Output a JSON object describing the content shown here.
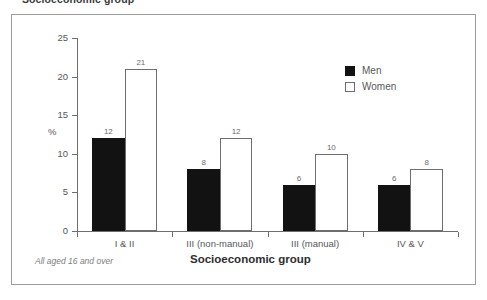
{
  "figure": {
    "title_fragment": "Socioeconomic group",
    "footnote": "All aged 16 and over"
  },
  "legend": {
    "position": "top-right",
    "entries": [
      {
        "label": "Men",
        "swatch": "black-filled-square"
      },
      {
        "label": "Women",
        "swatch": "white-outlined-square"
      }
    ]
  },
  "axes": {
    "y_title": "%",
    "x_title": "Socioeconomic group",
    "y_ticks": [
      "0",
      "5",
      "10",
      "15",
      "20",
      "25"
    ]
  },
  "chart_data": {
    "type": "bar",
    "title": "",
    "subtitle": "",
    "xlabel": "Socioeconomic group",
    "ylabel": "%",
    "categories": [
      "I & II",
      "III (non-manual)",
      "III (manual)",
      "IV & V"
    ],
    "series": [
      {
        "name": "Men",
        "values": [
          12,
          8,
          6,
          6
        ],
        "color": "#121212"
      },
      {
        "name": "Women",
        "values": [
          21,
          12,
          10,
          8
        ],
        "color": "#ffffff"
      }
    ],
    "ylim": [
      0,
      25
    ],
    "yticks": [
      0,
      5,
      10,
      15,
      20,
      25
    ],
    "grid": false,
    "legend_position": "top-right",
    "data_labels": true,
    "annotation": "All aged 16 and over"
  }
}
